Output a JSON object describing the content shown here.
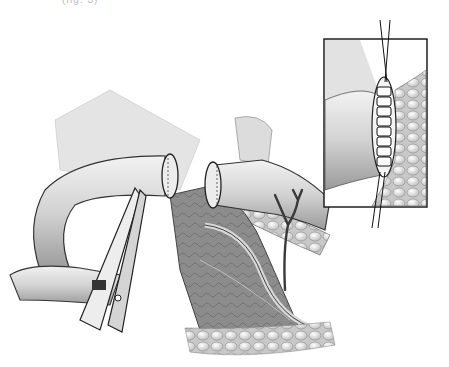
{
  "figure": {
    "caption_fragment": "(fig. 3)",
    "inset": {
      "label": "magnified sutured closure",
      "stitch_count": 8
    },
    "colors": {
      "background": "#ffffff",
      "tissue_light": "#e6e6e6",
      "tissue_mid": "#b8b8b8",
      "tissue_dark": "#6e6e6e",
      "outline": "#222222"
    }
  }
}
